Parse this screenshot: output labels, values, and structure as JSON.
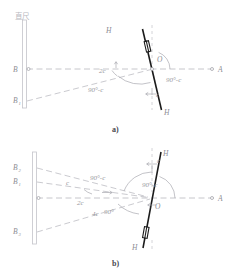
{
  "figure": {
    "title_note": "直尺",
    "panels": [
      {
        "id": "a",
        "caption": "a)",
        "ruler_label": "直尺",
        "points": [
          {
            "name": "B",
            "label": "B",
            "sub": ""
          },
          {
            "name": "B1",
            "label": "B",
            "sub": "1"
          },
          {
            "name": "O",
            "label": "O",
            "sub": ""
          },
          {
            "name": "A",
            "label": "A",
            "sub": ""
          }
        ],
        "axis_labels": {
          "upper_h": "H",
          "lower_h": "H"
        },
        "angles": [
          {
            "name": "two-c",
            "label": "2c"
          },
          {
            "name": "ninety-minus-c-left",
            "label": "90°-c"
          },
          {
            "name": "ninety-minus-c-right",
            "label": "90°-c"
          },
          {
            "name": "c-small",
            "label": "c"
          }
        ]
      },
      {
        "id": "b",
        "caption": "b)",
        "ruler_label": "",
        "points": [
          {
            "name": "B2",
            "label": "B",
            "sub": "2"
          },
          {
            "name": "B1",
            "label": "B",
            "sub": "1"
          },
          {
            "name": "B3",
            "label": "B",
            "sub": "3"
          },
          {
            "name": "O",
            "label": "O",
            "sub": ""
          },
          {
            "name": "A",
            "label": "A",
            "sub": ""
          }
        ],
        "axis_labels": {
          "upper_h": "H",
          "lower_h": "H"
        },
        "angles": [
          {
            "name": "c-upper",
            "label": "c"
          },
          {
            "name": "ninety-minus-c-upper",
            "label": "90°-c"
          },
          {
            "name": "ninety-minus-c-right",
            "label": "90°-c"
          },
          {
            "name": "two-c",
            "label": "2c"
          },
          {
            "name": "four-c",
            "label": "4c"
          },
          {
            "name": "ninety",
            "label": "90°"
          },
          {
            "name": "c-small",
            "label": "c"
          }
        ]
      }
    ],
    "colors": {
      "ruler": "#c9c9cf",
      "dashed": "#b3b3ba",
      "solid_dark": "#1b1b1b",
      "text": "#8d8d93",
      "caption": "#4a4a4f",
      "background": "#ffffff"
    }
  }
}
